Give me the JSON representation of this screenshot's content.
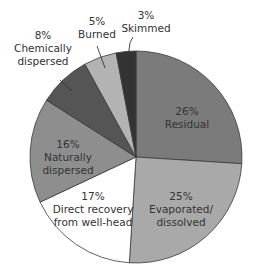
{
  "chart_data": {
    "type": "pie",
    "title": "",
    "start_angle_deg": 0,
    "direction": "clockwise",
    "slices": [
      {
        "label": "Residual",
        "pct_label": "26%",
        "value": 26,
        "color": "#7b7b7b"
      },
      {
        "label": "Evaporated/ dissolved",
        "pct_label": "25%",
        "value": 25,
        "color": "#a9a9a9"
      },
      {
        "label": "Direct recovery from well-head",
        "pct_label": "17%",
        "value": 17,
        "color": "#ffffff"
      },
      {
        "label": "Naturally dispersed",
        "pct_label": "16%",
        "value": 16,
        "color": "#8e8e8e"
      },
      {
        "label": "Chemically dispersed",
        "pct_label": "8%",
        "value": 8,
        "color": "#555555"
      },
      {
        "label": "Burned",
        "pct_label": "5%",
        "value": 5,
        "color": "#b3b3b3"
      },
      {
        "label": "Skimmed",
        "pct_label": "3%",
        "value": 3,
        "color": "#333333"
      }
    ]
  },
  "labels": {
    "residual": {
      "pct": "26%",
      "l1": "Residual"
    },
    "evaporated": {
      "pct": "25%",
      "l1": "Evaporated/",
      "l2": "dissolved"
    },
    "direct": {
      "pct": "17%",
      "l1": "Direct recovery",
      "l2": "from well-head"
    },
    "natural": {
      "pct": "16%",
      "l1": "Naturally",
      "l2": "dispersed"
    },
    "chemical": {
      "pct": "8%",
      "l1": "Chemically",
      "l2": "dispersed"
    },
    "burned": {
      "pct": "5%",
      "l1": "Burned"
    },
    "skimmed": {
      "pct": "3%",
      "l1": "Skimmed"
    }
  }
}
